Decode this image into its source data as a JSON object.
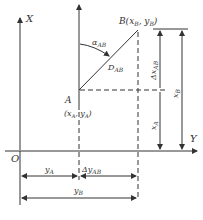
{
  "diagram": {
    "axes": {
      "x_axis_label": "X",
      "y_axis_label": "Y",
      "origin_label": "O"
    },
    "points": {
      "A": {
        "name": "A",
        "coords": "(xₐ, yₐ)",
        "coords_text": "(x_A, y_A)"
      },
      "B": {
        "name": "B",
        "coords_text": "B(x_B, y_B)"
      }
    },
    "labels": {
      "azimuth": "α_AB",
      "distance": "D_AB",
      "delta_x": "Δx_AB",
      "delta_y": "Δy_AB",
      "x_A": "x_A",
      "x_B": "x_B",
      "y_A": "y_A",
      "y_B": "y_B"
    },
    "caption": ""
  }
}
